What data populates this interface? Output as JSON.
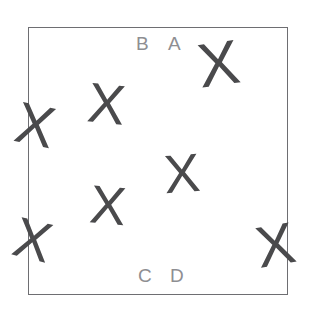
{
  "scene": {
    "width": 310,
    "height": 319,
    "background_color": "#ffffff",
    "description": "square panel with scattered X marks and four corner letter labels"
  },
  "panel": {
    "name": "bounding-box",
    "left": 28,
    "top": 27,
    "width": 260,
    "height": 268,
    "border_color": "#6e6e72",
    "border_width": 1.5,
    "fill_color": "#ffffff"
  },
  "labels": {
    "color": "#8e8e92",
    "font_size": 19,
    "items": [
      {
        "id": "label-b",
        "text": "B",
        "x": 136,
        "y": 34
      },
      {
        "id": "label-a",
        "text": "A",
        "x": 168,
        "y": 34
      },
      {
        "id": "label-c",
        "text": "C",
        "x": 138,
        "y": 266
      },
      {
        "id": "label-d",
        "text": "D",
        "x": 170,
        "y": 266
      }
    ]
  },
  "marks": {
    "glyph": "X",
    "color": "#4a4a4c",
    "items": [
      {
        "id": "x-top-right",
        "text": "X",
        "x": 198,
        "y": 33,
        "size": 62,
        "rotate": -8,
        "clipped": "none"
      },
      {
        "id": "x-upper-left",
        "text": "X",
        "x": 88,
        "y": 76,
        "size": 56,
        "rotate": 6,
        "clipped": "none"
      },
      {
        "id": "x-left-edge",
        "text": "X",
        "x": 16,
        "y": 96,
        "size": 58,
        "rotate": 12,
        "clipped": "left-border"
      },
      {
        "id": "x-center",
        "text": "X",
        "x": 164,
        "y": 146,
        "size": 54,
        "rotate": -4,
        "clipped": "none"
      },
      {
        "id": "x-lower-left",
        "text": "X",
        "x": 90,
        "y": 178,
        "size": 54,
        "rotate": 5,
        "clipped": "none"
      },
      {
        "id": "x-bottom-left",
        "text": "X",
        "x": 14,
        "y": 212,
        "size": 56,
        "rotate": 14,
        "clipped": "left-border"
      },
      {
        "id": "x-bottom-right",
        "text": "X",
        "x": 256,
        "y": 216,
        "size": 58,
        "rotate": -10,
        "clipped": "right-border"
      }
    ]
  }
}
